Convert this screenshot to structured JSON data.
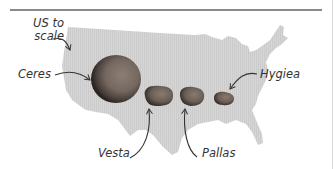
{
  "figure": {
    "map_label": "US to scale",
    "map_color": "#d4d4d4",
    "asteroids": [
      {
        "name": "Ceres",
        "color": "#7a6a60"
      },
      {
        "name": "Vesta",
        "color": "#6e6058"
      },
      {
        "name": "Pallas",
        "color": "#6a5e58"
      },
      {
        "name": "Hygiea",
        "color": "#5e534e"
      }
    ]
  }
}
